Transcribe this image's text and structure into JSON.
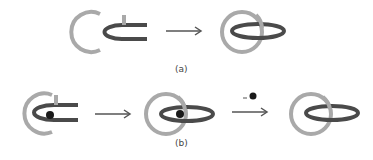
{
  "colors": {
    "light_ring": "#a9a9a9",
    "dark_ring": "#4a4a4a",
    "arrow": "#555555",
    "dot": "#1a1a1a"
  },
  "panels": [
    {
      "label": "(a)",
      "steps": [
        "open-rings",
        "linked-rings"
      ],
      "arrows": [
        {
          "annotation": ""
        }
      ]
    },
    {
      "label": "(b)",
      "steps": [
        "open-rings-with-dot",
        "linked-rings-with-dot",
        "linked-rings"
      ],
      "arrows": [
        {
          "annotation": ""
        },
        {
          "annotation": "–"
        }
      ]
    }
  ]
}
